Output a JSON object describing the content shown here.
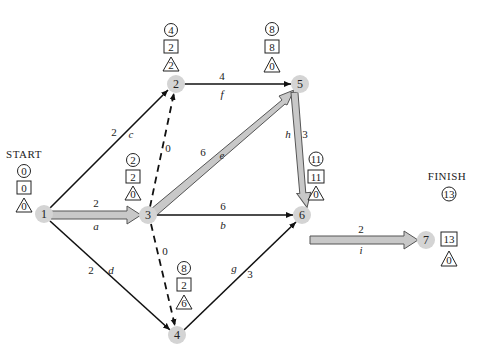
{
  "diagram": {
    "start_label": "START",
    "finish_label": "FINISH",
    "legend": {
      "circle": "earliest time",
      "square": "latest time",
      "triangle": "slack"
    },
    "colors": {
      "node_fill": "#d4d4d4",
      "critical_arrow_fill": "#c8c8c8",
      "line": "#111111"
    },
    "nodes": [
      {
        "id": "1",
        "label": "1",
        "earliest": "0",
        "latest": "0",
        "slack": "0"
      },
      {
        "id": "2",
        "label": "2",
        "earliest": "4",
        "latest": "2",
        "slack": "2"
      },
      {
        "id": "3",
        "label": "3",
        "earliest": "2",
        "latest": "2",
        "slack": "0"
      },
      {
        "id": "4",
        "label": "4",
        "earliest": "8",
        "latest": "2",
        "slack": "6"
      },
      {
        "id": "5",
        "label": "5",
        "earliest": "8",
        "latest": "8",
        "slack": "0"
      },
      {
        "id": "6",
        "label": "6",
        "earliest": "11",
        "latest": "11",
        "slack": "0"
      },
      {
        "id": "7",
        "label": "7",
        "earliest": "13",
        "latest": "13",
        "slack": "0"
      }
    ],
    "activities": [
      {
        "name": "a",
        "from": "1",
        "to": "3",
        "duration": "2",
        "critical": true
      },
      {
        "name": "c",
        "from": "1",
        "to": "2",
        "duration": "2",
        "critical": false
      },
      {
        "name": "d",
        "from": "1",
        "to": "4",
        "duration": "2",
        "critical": false
      },
      {
        "name": "",
        "from": "3",
        "to": "2",
        "duration": "0",
        "critical": false,
        "dummy": true
      },
      {
        "name": "",
        "from": "3",
        "to": "4",
        "duration": "0",
        "critical": false,
        "dummy": true
      },
      {
        "name": "e",
        "from": "3",
        "to": "5",
        "duration": "6",
        "critical": true
      },
      {
        "name": "b",
        "from": "3",
        "to": "6",
        "duration": "6",
        "critical": false
      },
      {
        "name": "f",
        "from": "2",
        "to": "5",
        "duration": "4",
        "critical": false
      },
      {
        "name": "h",
        "from": "5",
        "to": "6",
        "duration": "3",
        "critical": true
      },
      {
        "name": "g",
        "from": "4",
        "to": "6",
        "duration": "3",
        "critical": false
      },
      {
        "name": "i",
        "from": "6",
        "to": "7",
        "duration": "2",
        "critical": true
      }
    ]
  }
}
